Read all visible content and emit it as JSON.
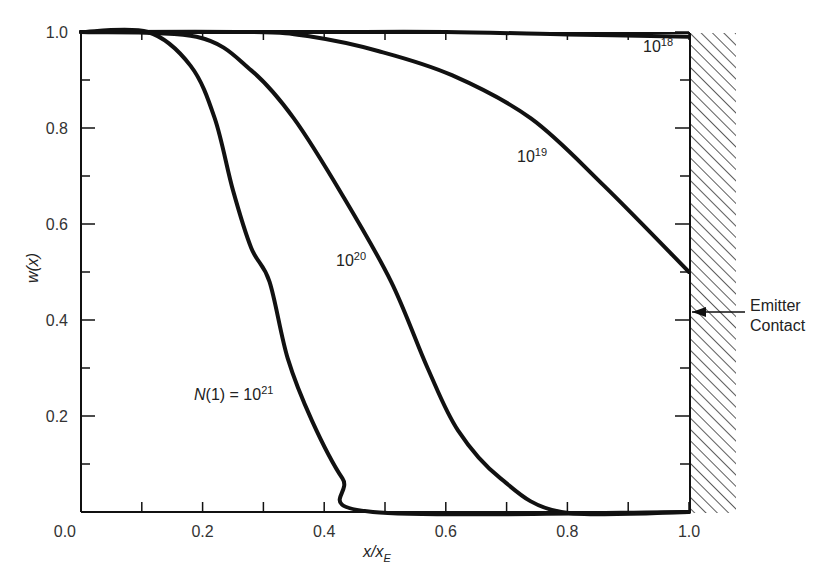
{
  "chart_data": {
    "type": "line",
    "title": "",
    "xlabel": "x/x_E",
    "ylabel": "w(x)",
    "xlim": [
      0.0,
      1.0
    ],
    "ylim": [
      0.0,
      1.0
    ],
    "grid": false,
    "x_ticks": [
      "0.0",
      "0.2",
      "0.4",
      "0.6",
      "0.8",
      "1.0"
    ],
    "y_ticks": [
      "0.0",
      "0.2",
      "0.4",
      "0.6",
      "0.8",
      "1.0"
    ],
    "series": [
      {
        "name": "10^18",
        "label_base": "10",
        "label_exp": "18",
        "points": [
          [
            0.0,
            1.0
          ],
          [
            0.2,
            1.0
          ],
          [
            0.4,
            1.0
          ],
          [
            0.6,
            1.0
          ],
          [
            0.8,
            0.995
          ],
          [
            1.0,
            0.99
          ]
        ]
      },
      {
        "name": "10^19",
        "label_base": "10",
        "label_exp": "19",
        "points": [
          [
            0.0,
            1.0
          ],
          [
            0.28,
            1.0
          ],
          [
            0.38,
            0.99
          ],
          [
            0.49,
            0.96
          ],
          [
            0.61,
            0.91
          ],
          [
            0.74,
            0.82
          ],
          [
            0.86,
            0.68
          ],
          [
            1.0,
            0.5
          ]
        ]
      },
      {
        "name": "10^20",
        "label_base": "10",
        "label_exp": "20",
        "points": [
          [
            0.0,
            1.0
          ],
          [
            0.19,
            0.99
          ],
          [
            0.28,
            0.92
          ],
          [
            0.35,
            0.82
          ],
          [
            0.43,
            0.66
          ],
          [
            0.51,
            0.48
          ],
          [
            0.57,
            0.3
          ],
          [
            0.62,
            0.17
          ],
          [
            0.69,
            0.07
          ],
          [
            0.79,
            0.0
          ],
          [
            1.0,
            0.0
          ]
        ]
      },
      {
        "name": "N(1) = 10^21",
        "label_base": "N(1) = 10",
        "label_exp": "21",
        "points": [
          [
            0.0,
            1.0
          ],
          [
            0.11,
            1.0
          ],
          [
            0.18,
            0.93
          ],
          [
            0.22,
            0.82
          ],
          [
            0.25,
            0.67
          ],
          [
            0.28,
            0.55
          ],
          [
            0.31,
            0.48
          ],
          [
            0.34,
            0.32
          ],
          [
            0.38,
            0.19
          ],
          [
            0.43,
            0.07
          ],
          [
            0.48,
            0.0
          ],
          [
            1.0,
            0.0
          ]
        ]
      }
    ],
    "annotations": [
      {
        "text": "Emitter Contact",
        "line1": "Emitter",
        "line2": "Contact",
        "points_to": [
          1.0,
          0.42
        ]
      }
    ]
  }
}
